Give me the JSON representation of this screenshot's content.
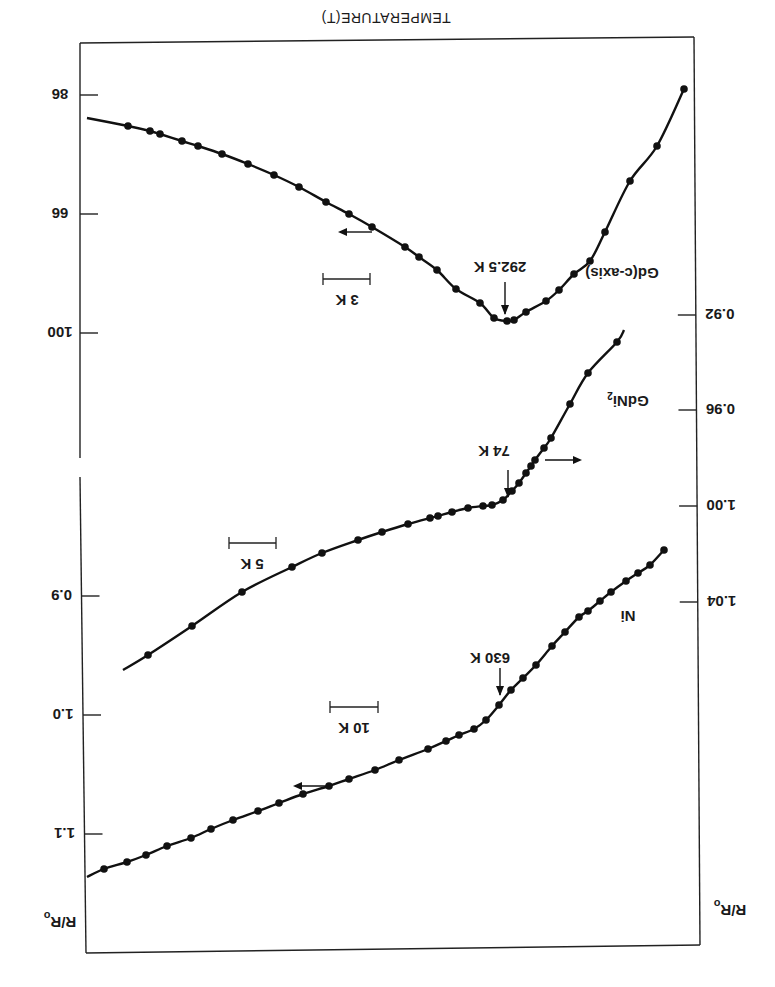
{
  "figure": {
    "orientation": "rotated 180 degrees",
    "title": "TEMPERATURE(T)",
    "left_axis_label": "R/R",
    "left_axis_label_sub": "o",
    "right_axis_label": "R/R",
    "right_axis_label_sub": "o",
    "left_ticks": [
      {
        "label": "86",
        "y": 95
      },
      {
        "label": "66",
        "y": 214
      },
      {
        "label": "100",
        "y": 333
      },
      {
        "label": "0.9",
        "y": 596
      },
      {
        "label": "1.0",
        "y": 715
      },
      {
        "label": "1.1",
        "y": 834
      }
    ],
    "right_ticks": [
      {
        "label": "0.92",
        "y": 315
      },
      {
        "label": "0.96",
        "y": 410
      },
      {
        "label": "1.00",
        "y": 506
      },
      {
        "label": "1.04",
        "y": 602
      }
    ],
    "annotations": {
      "gd_tc": "292.5 K",
      "gdni2_tc": "74 K",
      "ni_tc": "630 K",
      "gd_label": "Gd(c-axis)",
      "gdni2_label": "GdNi",
      "gdni2_sub": "2",
      "ni_label": "Ni",
      "scale_gd": "3 K",
      "scale_gdni2": "5 K",
      "scale_ni": "10 K"
    }
  },
  "chart_data": {
    "type": "line",
    "title": "TEMPERATURE(T)",
    "xlabel": "TEMPERATURE(T)",
    "ylabel": "R/Ro",
    "note": "Figure printed upside down (rotated 180°). Three curves of normalized resistance vs temperature near magnetic transitions, each with its own temperature scale bar.",
    "left_axis_ticks": [
      "86",
      "66",
      "100",
      "0.9",
      "1.0",
      "1.1"
    ],
    "right_axis_ticks": [
      "0.92",
      "0.96",
      "1.00",
      "1.04"
    ],
    "series": [
      {
        "name": "Gd(c-axis)",
        "transition": "292.5 K",
        "scale_bar": "3 K",
        "axis": "left",
        "shape": "V-shaped minimum at transition",
        "points_px": [
          [
            87,
            118
          ],
          [
            128,
            126
          ],
          [
            150,
            131
          ],
          [
            160,
            134
          ],
          [
            182,
            141
          ],
          [
            198,
            146
          ],
          [
            222,
            154
          ],
          [
            248,
            164
          ],
          [
            274,
            175
          ],
          [
            299,
            187
          ],
          [
            326,
            202
          ],
          [
            349,
            214
          ],
          [
            372,
            227
          ],
          [
            405,
            247
          ],
          [
            419,
            257
          ],
          [
            437,
            270
          ],
          [
            456,
            289
          ],
          [
            480,
            303
          ],
          [
            494,
            318
          ],
          [
            507,
            321
          ],
          [
            514,
            320
          ],
          [
            526,
            312
          ],
          [
            546,
            301
          ],
          [
            559,
            290
          ],
          [
            574,
            274
          ],
          [
            590,
            261
          ],
          [
            605,
            232
          ],
          [
            630,
            181
          ],
          [
            657,
            146
          ],
          [
            684,
            89
          ]
        ]
      },
      {
        "name": "GdNi2",
        "transition": "74 K",
        "scale_bar": "5 K",
        "axis": "right",
        "shape": "kink at transition, steeper above",
        "points_px": [
          [
            123,
            670
          ],
          [
            148,
            655
          ],
          [
            192,
            626
          ],
          [
            242,
            592
          ],
          [
            292,
            567
          ],
          [
            322,
            553
          ],
          [
            358,
            540
          ],
          [
            382,
            532
          ],
          [
            408,
            524
          ],
          [
            430,
            518
          ],
          [
            438,
            516
          ],
          [
            452,
            512
          ],
          [
            468,
            508
          ],
          [
            483,
            506
          ],
          [
            492,
            505
          ],
          [
            503,
            500
          ],
          [
            512,
            491
          ],
          [
            519,
            483
          ],
          [
            526,
            473
          ],
          [
            531,
            466
          ],
          [
            535,
            460
          ],
          [
            544,
            448
          ],
          [
            551,
            438
          ],
          [
            570,
            404
          ],
          [
            588,
            373
          ],
          [
            617,
            342
          ],
          [
            624,
            330
          ]
        ]
      },
      {
        "name": "Ni",
        "transition": "630 K",
        "scale_bar": "10 K",
        "axis": "left",
        "shape": "kink at transition, steeper above",
        "points_px": [
          [
            87,
            877
          ],
          [
            104,
            869
          ],
          [
            127,
            862
          ],
          [
            146,
            855
          ],
          [
            167,
            846
          ],
          [
            191,
            838
          ],
          [
            211,
            829
          ],
          [
            233,
            820
          ],
          [
            258,
            811
          ],
          [
            279,
            803
          ],
          [
            303,
            794
          ],
          [
            329,
            786
          ],
          [
            349,
            779
          ],
          [
            375,
            770
          ],
          [
            399,
            760
          ],
          [
            428,
            749
          ],
          [
            446,
            741
          ],
          [
            459,
            735
          ],
          [
            474,
            729
          ],
          [
            486,
            720
          ],
          [
            499,
            705
          ],
          [
            511,
            690
          ],
          [
            523,
            678
          ],
          [
            536,
            665
          ],
          [
            552,
            646
          ],
          [
            565,
            632
          ],
          [
            579,
            617
          ],
          [
            588,
            611
          ],
          [
            600,
            601
          ],
          [
            611,
            592
          ],
          [
            626,
            581
          ],
          [
            638,
            573
          ],
          [
            650,
            565
          ],
          [
            664,
            550
          ]
        ]
      }
    ]
  }
}
